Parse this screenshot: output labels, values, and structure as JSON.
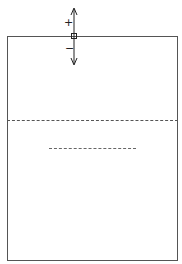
{
  "diagram": {
    "plus_label": "+",
    "minus_label": "−",
    "colors": {
      "line": "#555555",
      "background": "#ffffff"
    }
  }
}
